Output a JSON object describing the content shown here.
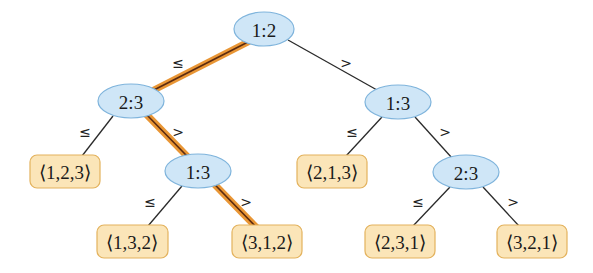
{
  "diagram": {
    "type": "decision-tree",
    "colors": {
      "internal_fill": "#cfe6f7",
      "internal_stroke": "#7fb4dc",
      "leaf_fill": "#fbe5b8",
      "leaf_stroke": "#e3b25d",
      "highlight_path": "#e8902a",
      "edge": "#2a2a2a"
    },
    "internal_nodes": [
      {
        "id": "n1",
        "label": "1:2",
        "cx": 264,
        "cy": 30
      },
      {
        "id": "n2",
        "label": "2:3",
        "cx": 131,
        "cy": 101
      },
      {
        "id": "n3",
        "label": "1:3",
        "cx": 398,
        "cy": 102
      },
      {
        "id": "n4",
        "label": "1:3",
        "cx": 198,
        "cy": 171
      },
      {
        "id": "n5",
        "label": "2:3",
        "cx": 466,
        "cy": 172
      }
    ],
    "leaves": [
      {
        "id": "l1",
        "label": "⟨1,2,3⟩",
        "x": 30,
        "y": 155
      },
      {
        "id": "l2",
        "label": "⟨2,1,3⟩",
        "x": 297,
        "y": 155
      },
      {
        "id": "l3",
        "label": "⟨1,3,2⟩",
        "x": 97,
        "y": 225
      },
      {
        "id": "l4",
        "label": "⟨3,1,2⟩",
        "x": 232,
        "y": 225
      },
      {
        "id": "l5",
        "label": "⟨2,3,1⟩",
        "x": 365,
        "y": 225
      },
      {
        "id": "l6",
        "label": "⟨3,2,1⟩",
        "x": 497,
        "y": 225
      }
    ],
    "edge_labels": {
      "le": "≤",
      "gt": ">"
    },
    "edges": [
      {
        "from": "n1",
        "to": "n2",
        "label": "≤",
        "highlighted": true
      },
      {
        "from": "n1",
        "to": "n3",
        "label": ">",
        "highlighted": false
      },
      {
        "from": "n2",
        "to": "l1",
        "label": "≤",
        "highlighted": false
      },
      {
        "from": "n2",
        "to": "n4",
        "label": ">",
        "highlighted": true
      },
      {
        "from": "n4",
        "to": "l3",
        "label": "≤",
        "highlighted": false
      },
      {
        "from": "n4",
        "to": "l4",
        "label": ">",
        "highlighted": true
      },
      {
        "from": "n3",
        "to": "l2",
        "label": "≤",
        "highlighted": false
      },
      {
        "from": "n3",
        "to": "n5",
        "label": ">",
        "highlighted": false
      },
      {
        "from": "n5",
        "to": "l5",
        "label": "≤",
        "highlighted": false
      },
      {
        "from": "n5",
        "to": "l6",
        "label": ">",
        "highlighted": false
      }
    ]
  }
}
